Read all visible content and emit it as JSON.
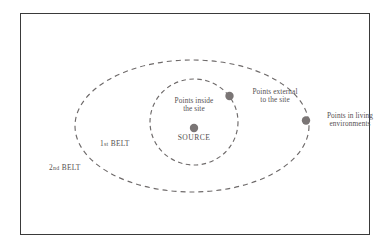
{
  "figure": {
    "background_color": "#ffffff",
    "frame_color": "#3a3a3a",
    "ink_color": "#555050",
    "marker_color": "#7a7575",
    "belt_line_color": "#6e6a6a"
  },
  "labels": {
    "points_inside": "Points inside\nthe site",
    "points_inside_line1": "Points inside",
    "points_inside_line2": "the site",
    "source": "SOURCE",
    "points_external_line1": "Points external",
    "points_external_line2": "to the site",
    "points_living_line1": "Points in living",
    "points_living_line2": "environments",
    "belt_1_number": "1",
    "belt_1_ordinal": "st",
    "belt_1_word": " BELT",
    "belt_2_number": "2",
    "belt_2_ordinal": "nd",
    "belt_2_word": " BELT"
  },
  "geometry": {
    "outer_belt": {
      "cx": 192,
      "cy": 126,
      "rx": 117,
      "ry": 66,
      "dash": "5 4"
    },
    "inner_belt": {
      "cx": 194,
      "cy": 122,
      "rx": 44,
      "ry": 43,
      "dash": "4.5 3.5"
    },
    "markers": [
      {
        "name": "source",
        "cx": 194,
        "cy": 128,
        "r": 4.2
      },
      {
        "name": "external",
        "cx": 229.5,
        "cy": 96,
        "r": 4.2
      },
      {
        "name": "living",
        "cx": 306,
        "cy": 120.5,
        "r": 4.2
      }
    ]
  }
}
